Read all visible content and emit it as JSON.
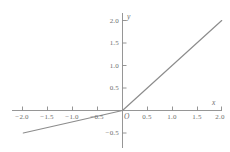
{
  "chart_data": {
    "type": "line",
    "title": "",
    "xlabel": "x",
    "ylabel": "y",
    "origin_label": "O",
    "xlim": [
      -2.25,
      2.15
    ],
    "ylim": [
      -0.62,
      2.15
    ],
    "grid": false,
    "legend": null,
    "line_color": "#8c8c8c",
    "axis_color": "#8a8a8a",
    "text_color": "#6e6e6e",
    "background": "#ffffff",
    "xticks": [
      -2.0,
      -1.5,
      -1.0,
      -0.5,
      0.5,
      1.0,
      1.5,
      2.0
    ],
    "xtick_labels": [
      "−2.0",
      "−1.5",
      "−1.0",
      "−0.5",
      "0.5",
      "1.0",
      "1.5",
      "2.0"
    ],
    "yticks": [
      -0.5,
      0.5,
      1.0,
      1.5,
      2.0
    ],
    "ytick_labels": [
      "−0.5",
      "0.5",
      "1.0",
      "1.5",
      "2.0"
    ],
    "series": [
      {
        "name": "piecewise-line",
        "description": "y = x for x >= 0; y = 0.25x for x < 0",
        "x": [
          -2.0,
          0.0,
          2.0
        ],
        "values": [
          -0.5,
          0.0,
          2.0
        ]
      }
    ]
  },
  "labels": {
    "x_axis_name": "x",
    "y_axis_name": "y",
    "origin": "O",
    "x_neg_2_0": "−2.0",
    "x_neg_1_5": "−1.5",
    "x_neg_1_0": "−1.0",
    "x_neg_0_5": "−0.5",
    "x_pos_0_5": "0.5",
    "x_pos_1_0": "1.0",
    "x_pos_1_5": "1.5",
    "x_pos_2_0": "2.0",
    "y_neg_0_5": "−0.5",
    "y_pos_0_5": "0.5",
    "y_pos_1_0": "1.0",
    "y_pos_1_5": "1.5",
    "y_pos_2_0": "2.0"
  }
}
